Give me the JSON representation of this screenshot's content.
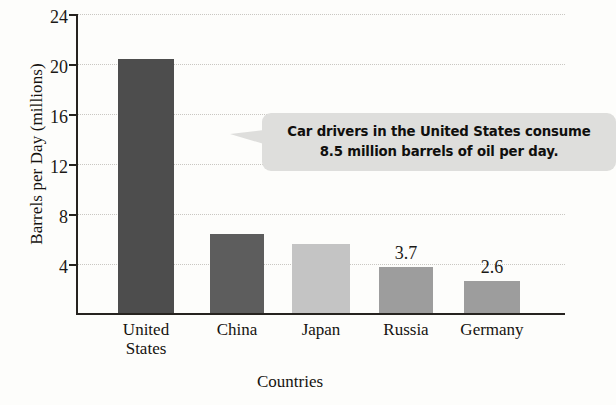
{
  "chart_data": {
    "type": "bar",
    "title": "",
    "xlabel": "Countries",
    "ylabel": "Barrels per Day (millions)",
    "categories": [
      "United States",
      "China",
      "Japan",
      "Russia",
      "Germany"
    ],
    "values": [
      20.3,
      6.3,
      5.5,
      3.7,
      2.6
    ],
    "value_labels": [
      "",
      "",
      "",
      "3.7",
      "2.6"
    ],
    "ylim": [
      0,
      24
    ],
    "yticks": [
      4,
      8,
      12,
      16,
      20,
      24
    ],
    "grid": true,
    "legend": "none",
    "bar_colors": [
      "#4d4d4d",
      "#5d5d5d",
      "#c4c4c4",
      "#9d9d9d",
      "#9d9d9d"
    ],
    "annotations": [
      {
        "text_line_1": "Car drivers in the United States consume",
        "text_line_2": "8.5 million barrels of oil per day.",
        "points_to": "United States"
      }
    ]
  },
  "axis": {
    "y_title": "Barrels per Day (millions)",
    "x_title": "Countries",
    "y_ticks": [
      "24",
      "20",
      "16",
      "12",
      "8",
      "4"
    ],
    "x_categories": [
      {
        "line1": "United",
        "line2": "States"
      },
      {
        "line1": "China",
        "line2": ""
      },
      {
        "line1": "Japan",
        "line2": ""
      },
      {
        "line1": "Russia",
        "line2": ""
      },
      {
        "line1": "Germany",
        "line2": ""
      }
    ]
  },
  "bar_labels": {
    "russia": "3.7",
    "germany": "2.6"
  },
  "callout": {
    "line1": "Car drivers in the United States consume",
    "line2": "8.5 million barrels of oil per day."
  }
}
